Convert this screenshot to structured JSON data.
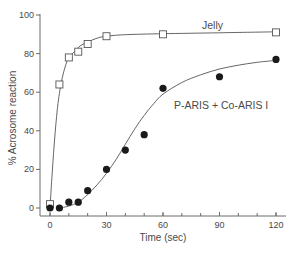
{
  "chart_data": {
    "type": "scatter",
    "title": "",
    "xlabel": "Time (sec)",
    "ylabel": "% Acrosome reaction",
    "xlim": [
      0,
      120
    ],
    "ylim": [
      0,
      100
    ],
    "x_ticks": [
      0,
      30,
      60,
      90,
      120
    ],
    "x_tick_labels": [
      "0",
      "30",
      "60",
      "90",
      "120"
    ],
    "x_minor_tick_step": 10,
    "y_ticks": [
      0,
      20,
      40,
      60,
      80,
      100
    ],
    "y_tick_labels": [
      "0",
      "20",
      "40",
      "60",
      "80",
      "100"
    ],
    "grid": false,
    "legend": "inline labels",
    "series": [
      {
        "name": "Jelly",
        "marker": "open-square",
        "color": "#555555",
        "x": [
          0,
          5,
          10,
          15,
          20,
          30,
          60,
          120
        ],
        "y": [
          2,
          64,
          78,
          81,
          85,
          89,
          90,
          91
        ],
        "fit_curve": [
          [
            0,
            0
          ],
          [
            2,
            30
          ],
          [
            4,
            52
          ],
          [
            6,
            65
          ],
          [
            8,
            73
          ],
          [
            10,
            78
          ],
          [
            13,
            81
          ],
          [
            16,
            84
          ],
          [
            20,
            86
          ],
          [
            25,
            88
          ],
          [
            30,
            89
          ],
          [
            40,
            89.8
          ],
          [
            60,
            90.3
          ],
          [
            90,
            90.8
          ],
          [
            120,
            91.3
          ]
        ]
      },
      {
        "name": "P-ARIS + Co-ARIS I",
        "marker": "filled-circle",
        "color": "#1a1a1a",
        "x": [
          0,
          5,
          10,
          15,
          20,
          30,
          40,
          50,
          60,
          90,
          120
        ],
        "y": [
          0,
          0,
          3,
          3,
          9,
          20,
          30,
          38,
          62,
          68,
          77
        ],
        "fit_curve": [
          [
            5,
            0
          ],
          [
            10,
            1
          ],
          [
            15,
            3
          ],
          [
            20,
            7
          ],
          [
            25,
            12
          ],
          [
            30,
            18
          ],
          [
            35,
            25
          ],
          [
            40,
            33
          ],
          [
            45,
            41
          ],
          [
            50,
            48
          ],
          [
            55,
            54
          ],
          [
            60,
            59
          ],
          [
            70,
            65
          ],
          [
            80,
            69
          ],
          [
            90,
            72
          ],
          [
            100,
            74
          ],
          [
            110,
            75.5
          ],
          [
            120,
            76.5
          ]
        ]
      }
    ],
    "annotations": [
      {
        "text": "Jelly",
        "x": 75,
        "y": 95
      },
      {
        "text": "P-ARIS + Co-ARIS I",
        "x": 65,
        "y": 54
      }
    ]
  },
  "labels": {
    "y_axis": "% Acrosome reaction",
    "x_axis": "Time (sec)",
    "series_jelly": "Jelly",
    "series_paris": "P-ARIS + Co-ARIS I",
    "x_ticks": [
      "0",
      "30",
      "60",
      "90",
      "120"
    ],
    "y_ticks": [
      "0",
      "20",
      "40",
      "60",
      "80",
      "100"
    ]
  }
}
